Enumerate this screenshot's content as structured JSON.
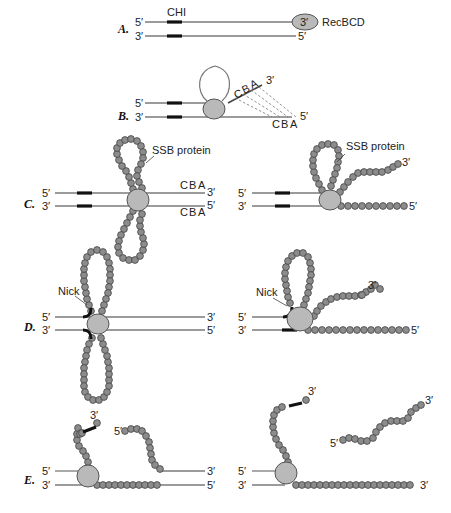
{
  "figure": {
    "panels": [
      {
        "id": "A",
        "label": "A.",
        "top_strand": {
          "left_end": "5′",
          "right_end": "3′"
        },
        "bottom_strand": {
          "left_end": "3′",
          "right_end": "5′"
        },
        "annotations": {
          "chi": "CHI",
          "enzyme": "RecBCD"
        }
      },
      {
        "id": "B",
        "label": "B.",
        "top_strand": {
          "left_end": "5′",
          "right_end": "3′"
        },
        "bottom_strand": {
          "left_end": "3′",
          "right_end": "5′"
        },
        "annotations": {
          "top_bases": [
            "C",
            "B",
            "A"
          ],
          "bottom_bases": [
            "C",
            "B",
            "A"
          ]
        }
      },
      {
        "id": "C",
        "label": "C.",
        "left": {
          "top_strand": {
            "left_end": "5′",
            "right_end": "3′"
          },
          "bottom_strand": {
            "left_end": "3′",
            "right_end": "5′"
          },
          "annotations": {
            "ssb": "SSB protein",
            "top_bases": [
              "C",
              "B",
              "A"
            ],
            "bottom_bases": [
              "C",
              "B",
              "A"
            ]
          }
        },
        "right": {
          "top_strand": {
            "left_end": "5′",
            "right_end": "3′"
          },
          "bottom_strand": {
            "left_end": "3′",
            "right_end": "5′"
          },
          "annotations": {
            "ssb": "SSB protein"
          }
        }
      },
      {
        "id": "D",
        "label": "D.",
        "left": {
          "top_strand": {
            "left_end": "5′",
            "right_end": "3′"
          },
          "bottom_strand": {
            "left_end": "3′",
            "right_end": "5′"
          },
          "annotations": {
            "nick": "Nick"
          }
        },
        "right": {
          "top_strand": {
            "left_end": "5′",
            "right_end": "3′"
          },
          "bottom_strand": {
            "left_end": "3′",
            "right_end": "5′"
          },
          "annotations": {
            "nick": "Nick"
          }
        }
      },
      {
        "id": "E",
        "label": "E.",
        "left": {
          "top_strand": {
            "left_end": "5′",
            "right_end": "3′"
          },
          "bottom_strand": {
            "left_end": "3′",
            "right_end": "5′"
          },
          "annotations": {
            "free_3": "3′",
            "free_5": "5′"
          }
        },
        "right": {
          "top_strand": {
            "left_end": "5′"
          },
          "bottom_strand": {
            "left_end": "3′",
            "right_end": "3′"
          },
          "annotations": {
            "free_3": "3′",
            "fragment_5": "5′",
            "fragment_3": "3′"
          }
        }
      }
    ],
    "colors": {
      "strand": "#7a7a7a",
      "chi": "#111111",
      "enzyme_fill": "#b9b9b9",
      "ssb_bead": "#8c8c8c"
    }
  }
}
